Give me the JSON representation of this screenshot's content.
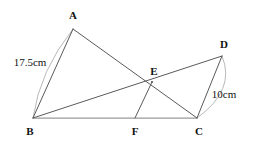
{
  "figure": {
    "type": "geometry-diagram",
    "width": 256,
    "height": 145,
    "background_color": "#ffffff",
    "stroke_color": "#5a5a5a",
    "baseline_color": "#9a9a9a",
    "arc_color": "#b0b0b0",
    "text_color": "#111111"
  },
  "points": {
    "A": {
      "label": "A",
      "x": 73,
      "y": 29,
      "label_x": 73,
      "label_y": 15
    },
    "B": {
      "label": "B",
      "x": 33,
      "y": 118,
      "label_x": 30,
      "label_y": 131
    },
    "C": {
      "label": "C",
      "x": 197,
      "y": 118,
      "label_x": 199,
      "label_y": 131
    },
    "D": {
      "label": "D",
      "x": 222,
      "y": 56,
      "label_x": 224,
      "label_y": 44
    },
    "E": {
      "label": "E",
      "x": 152,
      "y": 82,
      "label_x": 154,
      "label_y": 71
    },
    "F": {
      "label": "F",
      "x": 135,
      "y": 118,
      "label_x": 135,
      "label_y": 131
    }
  },
  "segments": [
    {
      "name": "segment-ab",
      "from": "A",
      "to": "B",
      "x1": 73,
      "y1": 29,
      "x2": 33,
      "y2": 118
    },
    {
      "name": "segment-ac",
      "from": "A",
      "to": "C",
      "x1": 73,
      "y1": 29,
      "x2": 197,
      "y2": 118
    },
    {
      "name": "segment-bd",
      "from": "B",
      "to": "D",
      "x1": 33,
      "y1": 118,
      "x2": 222,
      "y2": 56
    },
    {
      "name": "segment-bc",
      "from": "B",
      "to": "C",
      "x1": 33,
      "y1": 118,
      "x2": 197,
      "y2": 118
    },
    {
      "name": "segment-dc",
      "from": "D",
      "to": "C",
      "x1": 222,
      "y1": 56,
      "x2": 197,
      "y2": 118
    },
    {
      "name": "segment-ef",
      "from": "E",
      "to": "F",
      "x1": 152,
      "y1": 82,
      "x2": 135,
      "y2": 118
    }
  ],
  "measurements": [
    {
      "name": "measure-ab",
      "text": "17.5cm",
      "for_segment": "AB",
      "label_x": 30,
      "label_y": 62,
      "arc_path": "M 73 29 Q 40 70 33 118"
    },
    {
      "name": "measure-dc",
      "text": "10cm",
      "for_segment": "DC",
      "label_x": 224,
      "label_y": 94,
      "arc_path": "M 222 56 Q 236 90 197 118"
    }
  ]
}
